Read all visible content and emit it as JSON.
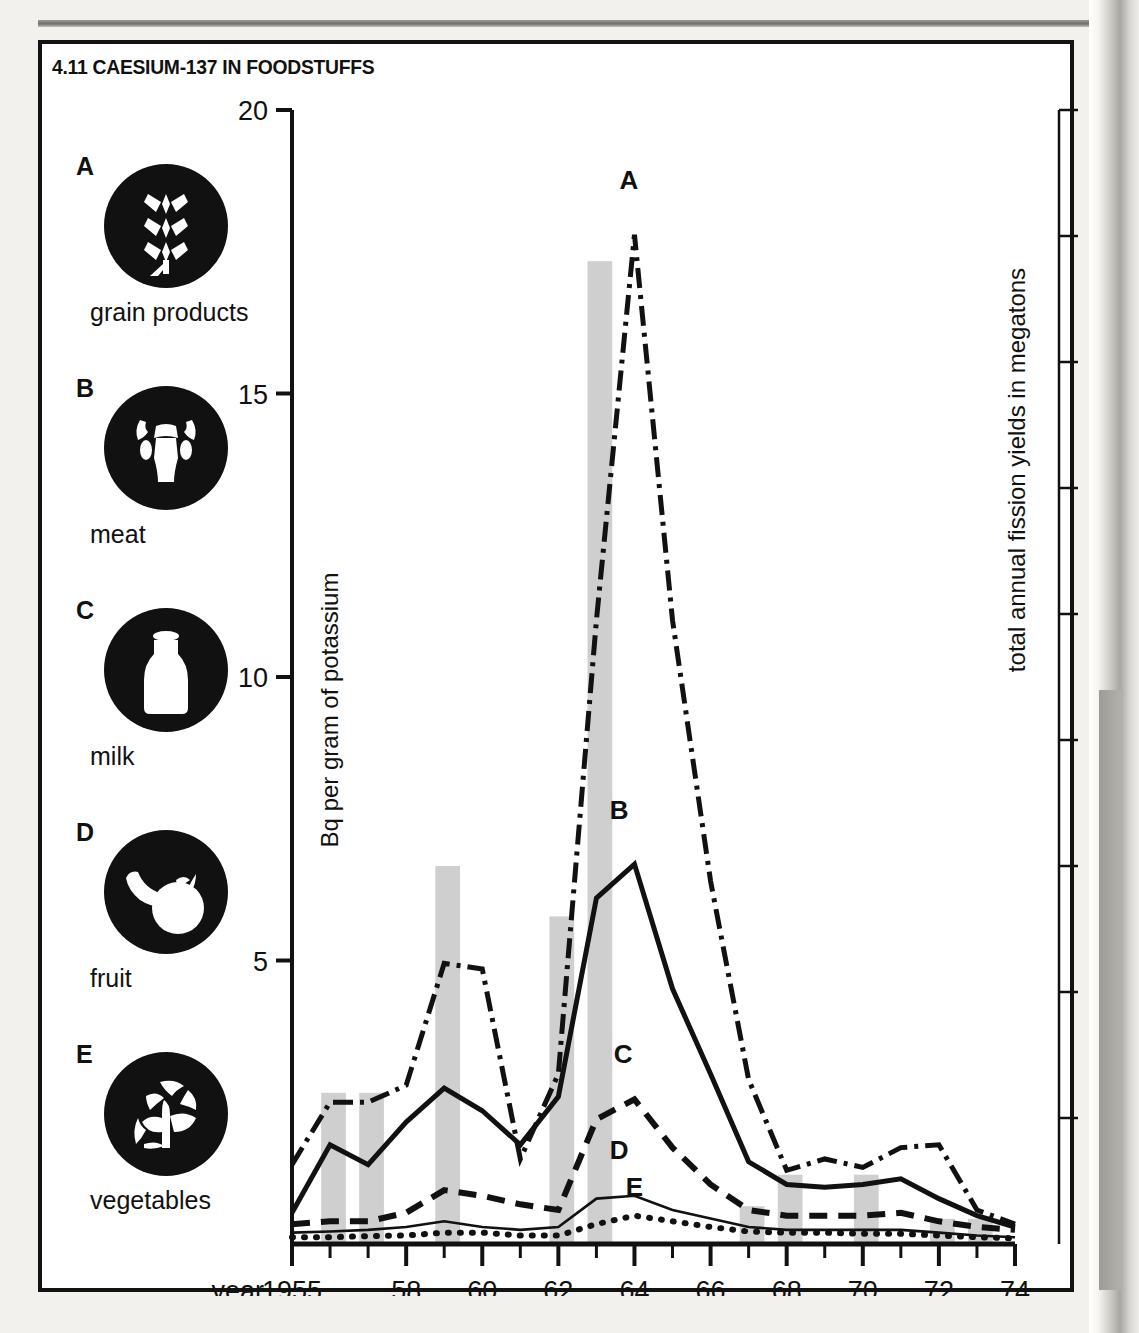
{
  "title": "4.11 CAESIUM-137 IN FOODSTUFFS",
  "legend": {
    "items": [
      {
        "key": "A",
        "label": "grain products",
        "icon": "wheat-icon"
      },
      {
        "key": "B",
        "label": "meat",
        "icon": "cow-head-icon"
      },
      {
        "key": "C",
        "label": "milk",
        "icon": "milk-bottle-icon"
      },
      {
        "key": "D",
        "label": "fruit",
        "icon": "fruit-icon"
      },
      {
        "key": "E",
        "label": "vegetables",
        "icon": "vegetables-icon"
      }
    ]
  },
  "chart_data": {
    "type": "line",
    "title": "4.11 CAESIUM-137 IN FOODSTUFFS",
    "xlabel": "year",
    "ylabel": "Bq per gram of potassium",
    "y2label": "total annual fission yields in megatons",
    "xlim": [
      1955,
      1974
    ],
    "ylim": [
      0,
      20
    ],
    "y2lim": [
      0,
      90
    ],
    "grid": false,
    "legend_position": "left-panel",
    "x_tick_labels": [
      "1955",
      "58",
      "60",
      "62",
      "64",
      "66",
      "68",
      "70",
      "72",
      "74"
    ],
    "x_tick_values": [
      1955,
      1958,
      1960,
      1962,
      1964,
      1966,
      1968,
      1970,
      1972,
      1974
    ],
    "x_minor_ticks": [
      1956,
      1957,
      1959,
      1961,
      1963,
      1965,
      1967,
      1969,
      1971,
      1973
    ],
    "y_tick_labels": [
      "5",
      "10",
      "15",
      "20"
    ],
    "y_tick_values": [
      5,
      10,
      15,
      20
    ],
    "y2_tick_labels": [
      "10",
      "20",
      "30",
      "40",
      "50",
      "60",
      "70",
      "80",
      "90"
    ],
    "y2_tick_values": [
      10,
      20,
      30,
      40,
      50,
      60,
      70,
      80,
      90
    ],
    "x": [
      1955,
      1956,
      1957,
      1958,
      1959,
      1960,
      1961,
      1962,
      1963,
      1964,
      1965,
      1966,
      1967,
      1968,
      1969,
      1970,
      1971,
      1972,
      1973,
      1974
    ],
    "bars": {
      "name": "total annual fission yields in megatons",
      "axis": "right",
      "color": "#cfcfcf",
      "values": [
        0,
        12,
        12,
        0,
        30,
        0,
        0,
        26,
        78,
        0,
        0,
        0,
        3,
        5.5,
        0,
        5.5,
        0,
        2,
        2,
        0
      ]
    },
    "series": [
      {
        "name": "grain products",
        "key": "A",
        "style": "dash-dot",
        "axis": "left",
        "values": [
          1.4,
          2.5,
          2.5,
          2.8,
          4.95,
          4.85,
          1.5,
          3.0,
          11.0,
          17.8,
          11.0,
          6.4,
          2.9,
          1.3,
          1.5,
          1.35,
          1.7,
          1.75,
          0.6,
          0.35
        ]
      },
      {
        "name": "meat",
        "key": "B",
        "style": "solid-thick",
        "axis": "left",
        "values": [
          0.55,
          1.75,
          1.4,
          2.15,
          2.75,
          2.35,
          1.75,
          2.6,
          6.1,
          6.7,
          4.5,
          3.0,
          1.45,
          1.05,
          1.0,
          1.05,
          1.15,
          0.8,
          0.5,
          0.3
        ]
      },
      {
        "name": "milk",
        "key": "C",
        "style": "dashed",
        "axis": "left",
        "values": [
          0.35,
          0.4,
          0.4,
          0.55,
          0.95,
          0.85,
          0.7,
          0.6,
          2.2,
          2.55,
          1.7,
          1.05,
          0.6,
          0.5,
          0.5,
          0.5,
          0.55,
          0.4,
          0.3,
          0.25
        ]
      },
      {
        "name": "fruit",
        "key": "D",
        "style": "thin-solid",
        "axis": "left",
        "values": [
          0.2,
          0.22,
          0.25,
          0.3,
          0.4,
          0.3,
          0.25,
          0.3,
          0.8,
          0.85,
          0.6,
          0.45,
          0.3,
          0.25,
          0.25,
          0.25,
          0.25,
          0.2,
          0.15,
          0.12
        ]
      },
      {
        "name": "vegetables",
        "key": "E",
        "style": "dotted",
        "axis": "left",
        "values": [
          0.12,
          0.12,
          0.14,
          0.15,
          0.2,
          0.2,
          0.15,
          0.15,
          0.35,
          0.5,
          0.4,
          0.3,
          0.22,
          0.2,
          0.2,
          0.18,
          0.18,
          0.15,
          0.12,
          0.1
        ]
      }
    ],
    "annotations": [
      {
        "label": "A",
        "x": 1963.85,
        "y": 18.6
      },
      {
        "label": "B",
        "x": 1963.6,
        "y": 7.5
      },
      {
        "label": "C",
        "x": 1963.7,
        "y": 3.2
      },
      {
        "label": "D",
        "x": 1963.6,
        "y": 1.5
      },
      {
        "label": "E",
        "x": 1964.0,
        "y": 0.85
      }
    ]
  },
  "colors": {
    "ink": "#111111",
    "bar_fill": "#cfcfcf",
    "paper": "#ffffff",
    "page": "#f2f1ee"
  }
}
